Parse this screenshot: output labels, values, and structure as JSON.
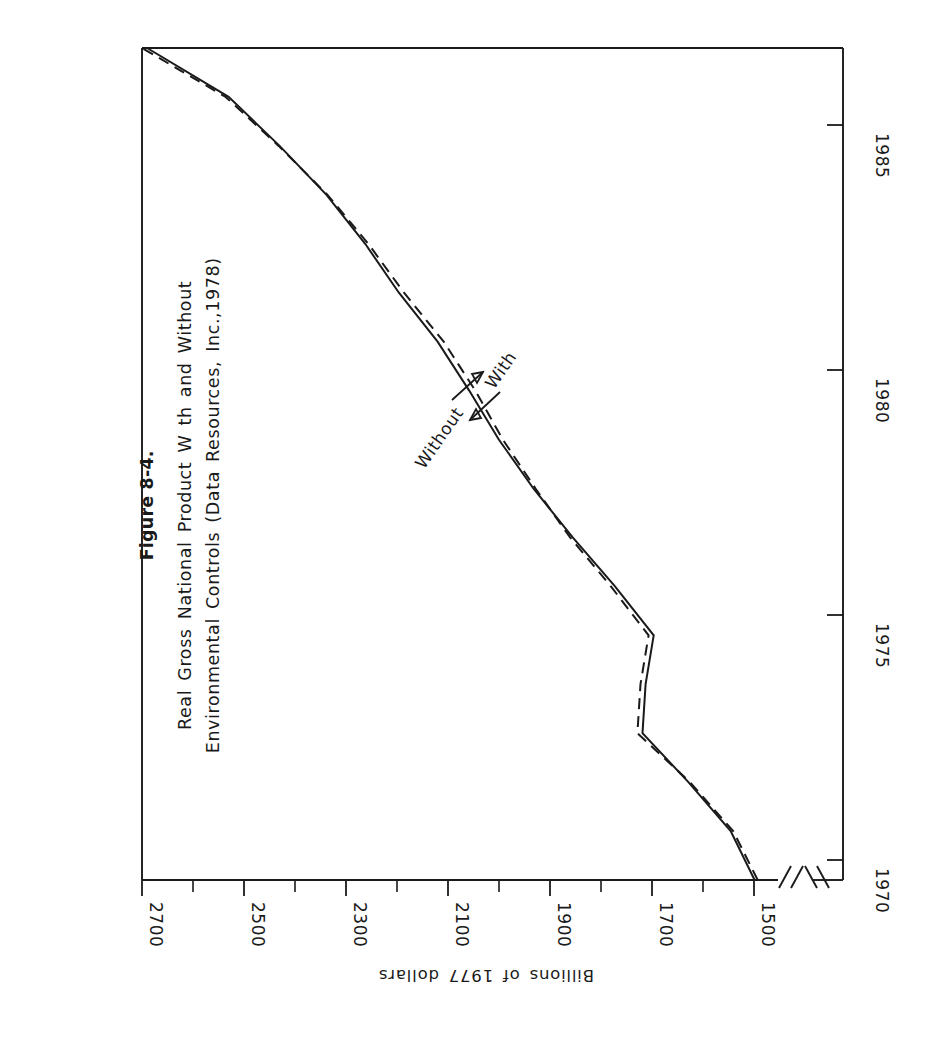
{
  "figure": {
    "number": "Figure 8-4.",
    "caption_line1": "Real Gross National Product W th and Without",
    "caption_line2": "Environmental Controls (Data Resources, Inc.,1978)"
  },
  "axes": {
    "value_axis_caption": "Billions of 1977 dollars",
    "value_tick_labels": [
      "2700",
      "2500",
      "2300",
      "2100",
      "1900",
      "1700",
      "1500"
    ],
    "year_tick_labels": [
      "1985",
      "1980",
      "1975",
      "1970"
    ],
    "axis_break_present": true
  },
  "annotations": [
    {
      "label": "Without",
      "series": "without"
    },
    {
      "label": "With",
      "series": "with"
    }
  ],
  "colors": {
    "ink": "#1a1a1a",
    "paper": "#ffffff"
  },
  "chart_data": {
    "type": "line",
    "xlabel": "",
    "ylabel": "Billions of 1977 dollars",
    "orientation": "rotated-90-ccw",
    "grid": false,
    "legend": "inline-annotations",
    "xlim": [
      1970,
      1987
    ],
    "ylim": [
      1500,
      2700
    ],
    "x_ticks": [
      1970,
      1975,
      1980,
      1985
    ],
    "y_ticks": [
      2700,
      2500,
      2300,
      2100,
      1900,
      1700,
      1500
    ],
    "y_minor_tick_step": 100,
    "x": [
      1970,
      1971,
      1972,
      1973,
      1974,
      1975,
      1976,
      1977,
      1978,
      1979,
      1980,
      1981,
      1982,
      1983,
      1984,
      1985,
      1986,
      1987
    ],
    "series": [
      {
        "name": "With",
        "style": "solid",
        "values": [
          1498,
          1545,
          1628,
          1718,
          1712,
          1696,
          1772,
          1855,
          1932,
          2000,
          2058,
          2120,
          2196,
          2262,
          2338,
          2430,
          2530,
          2690
        ]
      },
      {
        "name": "Without",
        "style": "dashed",
        "values": [
          1492,
          1540,
          1625,
          1728,
          1722,
          1706,
          1780,
          1860,
          1928,
          1992,
          2046,
          2108,
          2186,
          2256,
          2336,
          2432,
          2536,
          2700
        ]
      }
    ]
  }
}
